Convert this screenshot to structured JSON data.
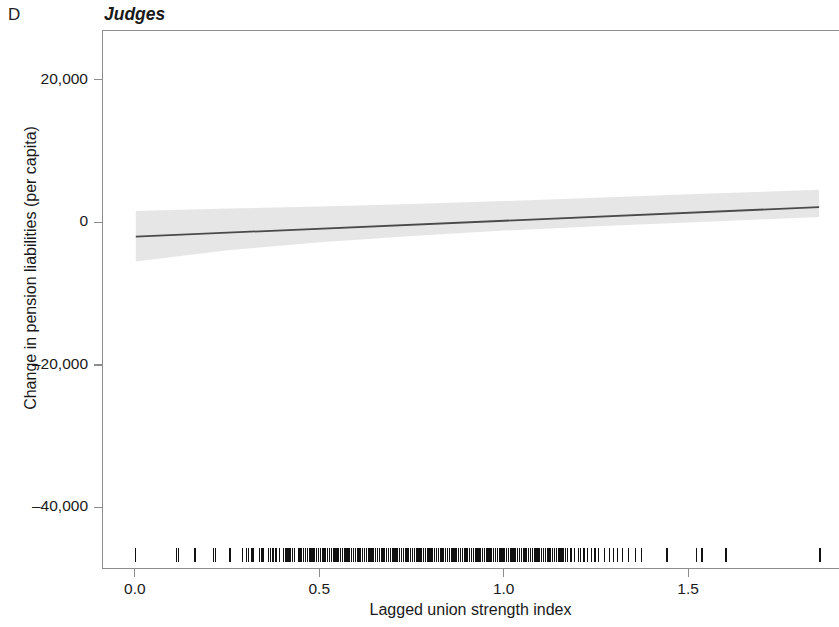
{
  "panel": {
    "letter": "D",
    "title": "Judges"
  },
  "axes": {
    "xlabel": "Lagged union strength index",
    "ylabel": "Change in pension liabilities (per capita)",
    "xticks": [
      "0.0",
      "0.5",
      "1.0",
      "1.5"
    ],
    "yticks": [
      "20,000",
      "0",
      "–20,000",
      "–40,000"
    ]
  },
  "colors": {
    "line": "#4a4a4a",
    "band": "#d9d9d9",
    "rug": "#111111",
    "axis": "#8d8d8d",
    "text": "#1a1a1a"
  },
  "chart_data": {
    "type": "line",
    "title": "Judges",
    "panel_label": "D",
    "xlabel": "Lagged union strength index",
    "ylabel": "Change in pension liabilities (per capita)",
    "xlim": [
      -0.089,
      1.909
    ],
    "ylim": [
      -48500,
      27000
    ],
    "xtick_values": [
      0.0,
      0.5,
      1.0,
      1.5
    ],
    "ytick_values": [
      20000,
      0,
      -20000,
      -40000
    ],
    "grid": false,
    "legend": false,
    "series": [
      {
        "name": "Fitted regression line",
        "kind": "line",
        "x": [
          0.0,
          1.855
        ],
        "y": [
          -1900,
          2250
        ]
      },
      {
        "name": "95% confidence band",
        "kind": "band",
        "x": [
          0.0,
          0.25,
          0.5,
          0.75,
          1.0,
          1.25,
          1.5,
          1.855
        ],
        "lower": [
          -5400,
          -3800,
          -2700,
          -1800,
          -1050,
          -450,
          100,
          850
        ],
        "upper": [
          1700,
          2050,
          2350,
          2700,
          3100,
          3550,
          4050,
          4700
        ]
      },
      {
        "name": "Rug (observed x values)",
        "kind": "rug",
        "y_position": -46500,
        "x": [
          0.0,
          0.11,
          0.115,
          0.16,
          0.162,
          0.21,
          0.215,
          0.255,
          0.29,
          0.3,
          0.305,
          0.315,
          0.318,
          0.335,
          0.34,
          0.345,
          0.36,
          0.365,
          0.372,
          0.38,
          0.39,
          0.4,
          0.405,
          0.41,
          0.415,
          0.42,
          0.425,
          0.43,
          0.44,
          0.445,
          0.45,
          0.455,
          0.46,
          0.465,
          0.47,
          0.475,
          0.48,
          0.485,
          0.49,
          0.495,
          0.5,
          0.505,
          0.51,
          0.515,
          0.52,
          0.525,
          0.53,
          0.535,
          0.54,
          0.545,
          0.55,
          0.555,
          0.56,
          0.565,
          0.57,
          0.575,
          0.58,
          0.585,
          0.59,
          0.595,
          0.6,
          0.605,
          0.61,
          0.615,
          0.62,
          0.625,
          0.63,
          0.635,
          0.64,
          0.645,
          0.65,
          0.655,
          0.66,
          0.665,
          0.67,
          0.675,
          0.68,
          0.685,
          0.69,
          0.695,
          0.7,
          0.705,
          0.71,
          0.715,
          0.72,
          0.725,
          0.73,
          0.735,
          0.74,
          0.745,
          0.75,
          0.755,
          0.76,
          0.765,
          0.77,
          0.775,
          0.78,
          0.785,
          0.79,
          0.795,
          0.8,
          0.805,
          0.81,
          0.815,
          0.82,
          0.825,
          0.83,
          0.835,
          0.84,
          0.845,
          0.85,
          0.855,
          0.86,
          0.865,
          0.87,
          0.875,
          0.88,
          0.885,
          0.89,
          0.895,
          0.9,
          0.905,
          0.91,
          0.915,
          0.92,
          0.925,
          0.93,
          0.935,
          0.94,
          0.945,
          0.95,
          0.955,
          0.96,
          0.965,
          0.97,
          0.975,
          0.98,
          0.985,
          0.99,
          0.995,
          1.0,
          1.005,
          1.01,
          1.015,
          1.02,
          1.025,
          1.03,
          1.035,
          1.04,
          1.045,
          1.05,
          1.055,
          1.06,
          1.065,
          1.07,
          1.075,
          1.08,
          1.085,
          1.09,
          1.095,
          1.1,
          1.105,
          1.11,
          1.115,
          1.12,
          1.125,
          1.13,
          1.135,
          1.14,
          1.145,
          1.15,
          1.155,
          1.16,
          1.165,
          1.17,
          1.18,
          1.19,
          1.2,
          1.205,
          1.215,
          1.225,
          1.235,
          1.245,
          1.255,
          1.27,
          1.285,
          1.295,
          1.305,
          1.32,
          1.335,
          1.355,
          1.37,
          1.44,
          1.52,
          1.535,
          1.6,
          1.855
        ]
      }
    ]
  }
}
